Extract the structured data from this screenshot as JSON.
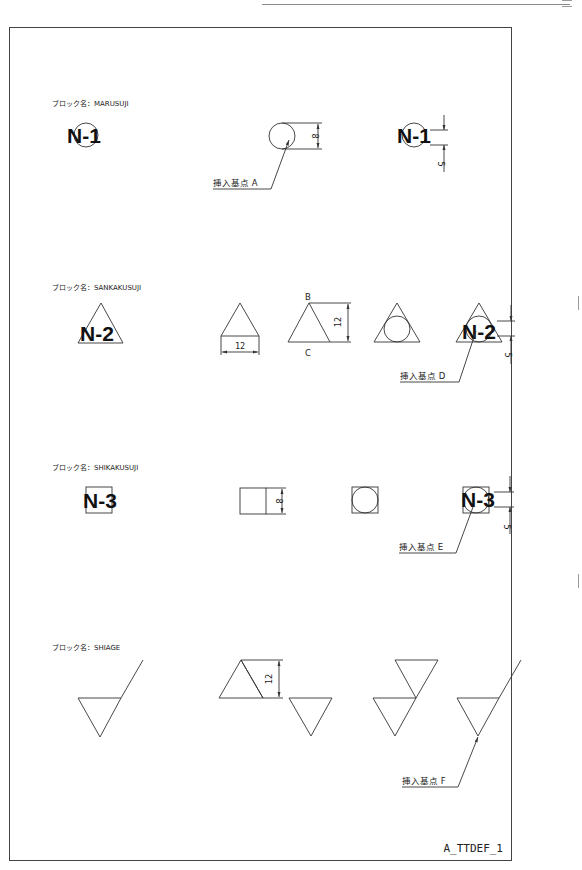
{
  "sheet": {
    "id": "A_TTDEF_1"
  },
  "sections": [
    {
      "block_label": "ブロック名：MARUSUJI",
      "symbol_text": "N-1",
      "shape": "circle",
      "dim_size": "8",
      "dim_offset": "5",
      "insert_point": "挿入基点 A"
    },
    {
      "block_label": "ブロック名：SANKAKUSUJI",
      "symbol_text": "N-2",
      "shape": "triangle",
      "dim_width": "12",
      "dim_height": "12",
      "vertex_top": "B",
      "vertex_bottom": "C",
      "dim_offset": "5",
      "insert_point": "挿入基点 D"
    },
    {
      "block_label": "ブロック名：SHIKAKUSUJI",
      "symbol_text": "N-3",
      "shape": "square",
      "dim_size": "8",
      "dim_offset": "5",
      "insert_point": "挿入基点 E"
    },
    {
      "block_label": "ブロック名：SHIAGE",
      "shape": "finish-mark",
      "dim_height": "12",
      "insert_point": "挿入基点 F"
    }
  ],
  "colors": {
    "line": "#333333",
    "border": "#444444",
    "background": "#ffffff"
  }
}
